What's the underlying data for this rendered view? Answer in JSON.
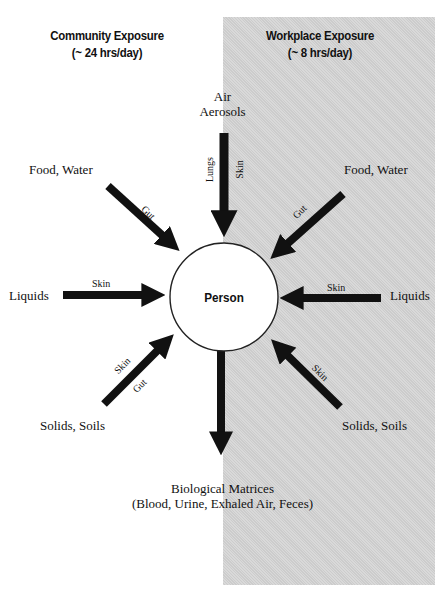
{
  "headings": {
    "community": {
      "title": "Community Exposure",
      "subtitle": "(~ 24 hrs/day)"
    },
    "workplace": {
      "title": "Workplace Exposure",
      "subtitle": "(~ 8 hrs/day)"
    }
  },
  "center": {
    "label": "Person"
  },
  "sources": {
    "air": {
      "line1": "Air",
      "line2": "Aerosols"
    },
    "food_water_left": "Food, Water",
    "food_water_right": "Food, Water",
    "liquids_left": "Liquids",
    "liquids_right": "Liquids",
    "solids_left": "Solids, Soils",
    "solids_right": "Solids, Soils",
    "biological": {
      "line1": "Biological Matrices",
      "line2": "(Blood, Urine, Exhaled Air, Feces)"
    }
  },
  "routes": {
    "air_lungs": "Lungs",
    "air_skin": "Skin",
    "food_left_gut": "Gut",
    "food_right_gut": "Gut",
    "liquids_left_skin": "Skin",
    "liquids_right_skin": "Skin",
    "solids_left_skin": "Skin",
    "solids_left_gut": "Gut",
    "solids_right_skin": "Skin"
  },
  "colors": {
    "panel": "#d4d4d4",
    "arrow": "#111111",
    "circle_fill": "#ffffff"
  }
}
